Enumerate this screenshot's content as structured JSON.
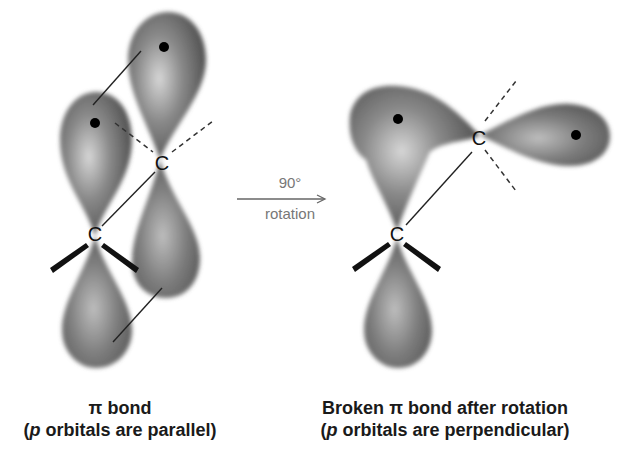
{
  "figure": {
    "left_panel": {
      "title_symbol": "π",
      "title_text": " bond",
      "subtitle_open": "(",
      "subtitle_italic": "p",
      "subtitle_rest": " orbitals are parallel)",
      "atom_labels": [
        "C",
        "C"
      ]
    },
    "arrow": {
      "top_label": "90°",
      "bottom_label": "rotation"
    },
    "right_panel": {
      "title_prefix": "Broken ",
      "title_symbol": "π",
      "title_suffix": " bond after rotation",
      "subtitle_open": "(",
      "subtitle_italic": "p",
      "subtitle_rest": " orbitals are perpendicular)",
      "atom_labels": [
        "C",
        "C"
      ]
    },
    "colors": {
      "orbital_dark": "#4a4a4a",
      "orbital_light": "#d8d8d8",
      "text": "#1a1a1a",
      "arrow": "#777777"
    }
  }
}
